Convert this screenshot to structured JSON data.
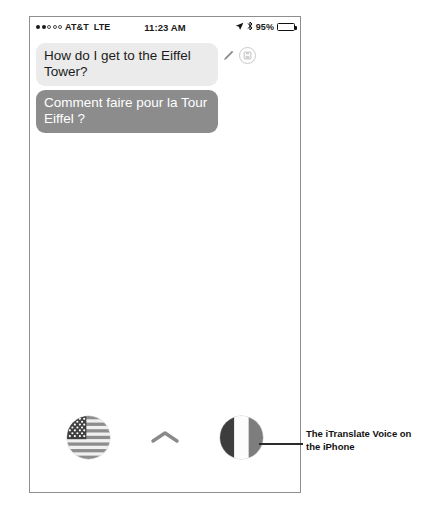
{
  "phone": {
    "status_bar": {
      "carrier": "AT&T",
      "network": "LTE",
      "time": "11:23 AM",
      "battery_percent": "95%",
      "signal_filled_dots": 2,
      "signal_hollow_dots": 3,
      "location_icon": "location-arrow-icon",
      "bluetooth_icon": "bluetooth-icon"
    },
    "conversation": {
      "messages": [
        {
          "text": "How do I get to the Eiffel Tower?",
          "kind": "incoming",
          "language": "en",
          "has_edit": true,
          "has_save": true
        },
        {
          "text": "Comment faire pour la Tour Eiffel ?",
          "kind": "translated",
          "language": "fr",
          "has_edit": false,
          "has_save": false
        }
      ]
    },
    "language_bar": {
      "source_language": "English (United States)",
      "source_flag": "us-flag-icon",
      "swap_label": "Swap languages",
      "swap_icon": "chevron-up-icon",
      "target_language": "French (France)",
      "target_flag": "france-flag-icon"
    }
  },
  "annotation": {
    "caption": "The iTranslate Voice on the iPhone"
  },
  "colors": {
    "incoming_bubble": "#ebebeb",
    "incoming_text": "#1c1c1c",
    "translated_bubble": "#8c8c8c",
    "translated_text": "#ffffff",
    "frame_border": "#8e8e8e",
    "annotation_text": "#111111"
  }
}
